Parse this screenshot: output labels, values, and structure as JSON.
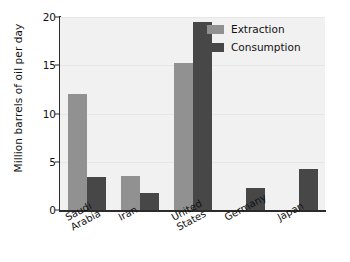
{
  "chart_data": {
    "type": "bar",
    "title": "",
    "xlabel": "",
    "ylabel": "Million barrels of oil per day",
    "categories": [
      "Saudi Arabia",
      "Iran",
      "United States",
      "Germany",
      "Japan"
    ],
    "category_lines": [
      [
        "Saudi",
        "Arabia"
      ],
      [
        "Iran"
      ],
      [
        "United",
        "States"
      ],
      [
        "Germany"
      ],
      [
        "Japan"
      ]
    ],
    "series": [
      {
        "name": "Extraction",
        "color": "#919191",
        "values": [
          12.0,
          3.5,
          15.2,
          0.05,
          0.0
        ]
      },
      {
        "name": "Consumption",
        "color": "#474747",
        "values": [
          3.4,
          1.8,
          19.5,
          2.3,
          4.2
        ]
      }
    ],
    "ylim": [
      0,
      20
    ],
    "yticks": [
      0,
      5,
      10,
      15,
      20
    ],
    "ytick_labels": [
      "0",
      "5",
      "10",
      "15",
      "20"
    ],
    "grid": true,
    "legend_position": "top-right",
    "legend_entries": [
      "Extraction",
      "Consumption"
    ]
  },
  "colors": {
    "extraction": "#919191",
    "consumption": "#474747",
    "plot_background": "#f1f1f1",
    "axis": "#2b2b2b",
    "gridline": "#e6e6e6",
    "text": "#111111"
  }
}
